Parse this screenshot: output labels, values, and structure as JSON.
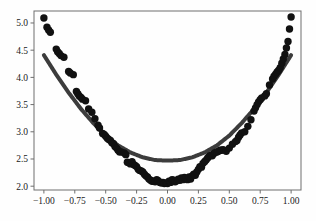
{
  "chart_data": {
    "type": "scatter",
    "title": "",
    "subtitle": "",
    "xlabel": "",
    "ylabel": "",
    "xlim": [
      -1.08,
      1.08
    ],
    "ylim": [
      1.93,
      5.22
    ],
    "grid": false,
    "legend": null,
    "legend_position": "none",
    "xticks": [
      -1.0,
      -0.75,
      -0.5,
      -0.25,
      0.0,
      0.25,
      0.5,
      0.75,
      1.0
    ],
    "xtick_labels": [
      "−1.00",
      "−0.75",
      "−0.50",
      "−0.25",
      "0.00",
      "0.25",
      "0.50",
      "0.75",
      "1.00"
    ],
    "yticks": [
      2.0,
      2.5,
      3.0,
      3.5,
      4.0,
      4.5,
      5.0
    ],
    "ytick_labels": [
      "2.0",
      "2.5",
      "3.0",
      "3.5",
      "4.0",
      "4.5",
      "5.0"
    ],
    "series": [
      {
        "name": "data points",
        "kind": "scatter",
        "color": "#111111",
        "marker": "circle",
        "marker_size": 5.2,
        "points": [
          [
            -1.0,
            5.09
          ],
          [
            -0.975,
            4.92
          ],
          [
            -0.962,
            4.87
          ],
          [
            -0.948,
            4.83
          ],
          [
            -0.9,
            4.52
          ],
          [
            -0.889,
            4.47
          ],
          [
            -0.876,
            4.44
          ],
          [
            -0.862,
            4.4
          ],
          [
            -0.838,
            4.37
          ],
          [
            -0.8,
            4.11
          ],
          [
            -0.787,
            4.08
          ],
          [
            -0.762,
            4.05
          ],
          [
            -0.737,
            3.74
          ],
          [
            -0.726,
            3.7
          ],
          [
            -0.714,
            3.66
          ],
          [
            -0.7,
            3.63
          ],
          [
            -0.688,
            3.6
          ],
          [
            -0.663,
            3.57
          ],
          [
            -0.638,
            3.42
          ],
          [
            -0.612,
            3.36
          ],
          [
            -0.587,
            3.24
          ],
          [
            -0.562,
            3.12
          ],
          [
            -0.55,
            3.07
          ],
          [
            -0.525,
            2.97
          ],
          [
            -0.512,
            2.95
          ],
          [
            -0.5,
            2.92
          ],
          [
            -0.487,
            2.88
          ],
          [
            -0.475,
            2.86
          ],
          [
            -0.462,
            2.84
          ],
          [
            -0.45,
            2.8
          ],
          [
            -0.437,
            2.78
          ],
          [
            -0.425,
            2.73
          ],
          [
            -0.412,
            2.7
          ],
          [
            -0.4,
            2.66
          ],
          [
            -0.387,
            2.63
          ],
          [
            -0.375,
            2.63
          ],
          [
            -0.35,
            2.61
          ],
          [
            -0.337,
            2.58
          ],
          [
            -0.325,
            2.44
          ],
          [
            -0.312,
            2.43
          ],
          [
            -0.3,
            2.41
          ],
          [
            -0.287,
            2.45
          ],
          [
            -0.275,
            2.4
          ],
          [
            -0.262,
            2.38
          ],
          [
            -0.25,
            2.36
          ],
          [
            -0.237,
            2.31
          ],
          [
            -0.225,
            2.29
          ],
          [
            -0.212,
            2.28
          ],
          [
            -0.2,
            2.26
          ],
          [
            -0.187,
            2.22
          ],
          [
            -0.175,
            2.19
          ],
          [
            -0.162,
            2.17
          ],
          [
            -0.15,
            2.13
          ],
          [
            -0.137,
            2.11
          ],
          [
            -0.125,
            2.09
          ],
          [
            -0.112,
            2.09
          ],
          [
            -0.1,
            2.08
          ],
          [
            -0.087,
            2.12
          ],
          [
            -0.075,
            2.1
          ],
          [
            -0.062,
            2.07
          ],
          [
            -0.05,
            2.06
          ],
          [
            -0.037,
            2.07
          ],
          [
            -0.025,
            2.05
          ],
          [
            -0.012,
            2.06
          ],
          [
            0.0,
            2.05
          ],
          [
            0.012,
            2.09
          ],
          [
            0.025,
            2.07
          ],
          [
            0.037,
            2.12
          ],
          [
            0.05,
            2.11
          ],
          [
            0.062,
            2.08
          ],
          [
            0.075,
            2.1
          ],
          [
            0.087,
            2.13
          ],
          [
            0.1,
            2.11
          ],
          [
            0.112,
            2.15
          ],
          [
            0.125,
            2.12
          ],
          [
            0.137,
            2.16
          ],
          [
            0.15,
            2.14
          ],
          [
            0.162,
            2.12
          ],
          [
            0.175,
            2.17
          ],
          [
            0.187,
            2.13
          ],
          [
            0.2,
            2.19
          ],
          [
            0.212,
            2.22
          ],
          [
            0.225,
            2.2
          ],
          [
            0.237,
            2.26
          ],
          [
            0.25,
            2.31
          ],
          [
            0.262,
            2.36
          ],
          [
            0.275,
            2.35
          ],
          [
            0.287,
            2.42
          ],
          [
            0.3,
            2.45
          ],
          [
            0.312,
            2.48
          ],
          [
            0.325,
            2.52
          ],
          [
            0.337,
            2.55
          ],
          [
            0.35,
            2.57
          ],
          [
            0.362,
            2.56
          ],
          [
            0.375,
            2.6
          ],
          [
            0.387,
            2.62
          ],
          [
            0.4,
            2.63
          ],
          [
            0.412,
            2.64
          ],
          [
            0.425,
            2.66
          ],
          [
            0.437,
            2.66
          ],
          [
            0.45,
            2.67
          ],
          [
            0.475,
            2.64
          ],
          [
            0.5,
            2.7
          ],
          [
            0.525,
            2.77
          ],
          [
            0.55,
            2.82
          ],
          [
            0.562,
            2.84
          ],
          [
            0.575,
            2.9
          ],
          [
            0.587,
            2.94
          ],
          [
            0.6,
            2.98
          ],
          [
            0.625,
            3.0
          ],
          [
            0.65,
            3.1
          ],
          [
            0.675,
            3.22
          ],
          [
            0.7,
            3.38
          ],
          [
            0.712,
            3.44
          ],
          [
            0.725,
            3.5
          ],
          [
            0.737,
            3.55
          ],
          [
            0.75,
            3.59
          ],
          [
            0.762,
            3.62
          ],
          [
            0.787,
            3.66
          ],
          [
            0.8,
            3.7
          ],
          [
            0.825,
            3.86
          ],
          [
            0.85,
            3.97
          ],
          [
            0.862,
            4.02
          ],
          [
            0.875,
            4.06
          ],
          [
            0.887,
            4.1
          ],
          [
            0.9,
            4.13
          ],
          [
            0.912,
            4.18
          ],
          [
            0.925,
            4.26
          ],
          [
            0.937,
            4.34
          ],
          [
            0.95,
            4.42
          ],
          [
            0.962,
            4.54
          ],
          [
            0.975,
            4.66
          ],
          [
            0.987,
            4.89
          ],
          [
            1.0,
            5.11
          ]
        ]
      },
      {
        "name": "fitted curve",
        "kind": "line",
        "color": "#3c3c3c",
        "line_width": 4.0,
        "equation_note": "y ≈ 2.48 + 1.93 x^2",
        "x": [
          -1.0,
          -0.9,
          -0.8,
          -0.7,
          -0.6,
          -0.5,
          -0.4,
          -0.3,
          -0.2,
          -0.1,
          0.0,
          0.1,
          0.2,
          0.3,
          0.4,
          0.5,
          0.6,
          0.7,
          0.8,
          0.9,
          1.0
        ],
        "y": [
          4.41,
          4.05,
          3.72,
          3.42,
          3.16,
          2.93,
          2.75,
          2.62,
          2.53,
          2.48,
          2.47,
          2.48,
          2.53,
          2.62,
          2.75,
          2.93,
          3.16,
          3.42,
          3.72,
          4.05,
          4.41
        ]
      }
    ],
    "colors": {
      "scatter": "#111111",
      "curve": "#3c3c3c",
      "axis": "#6e6e6e",
      "tick_label": "#1a1a1a",
      "background": "#fefefe"
    }
  },
  "figure": {
    "plot_left_px": 34,
    "plot_top_px": 11,
    "plot_right_px": 301,
    "plot_bottom_px": 190
  }
}
